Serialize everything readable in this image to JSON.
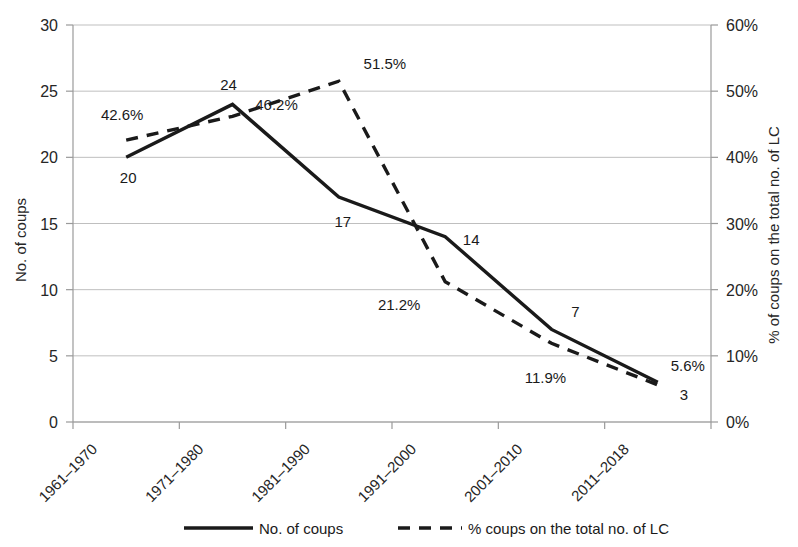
{
  "chart_data": {
    "type": "line",
    "title": "",
    "xlabel": "",
    "ylabel": "No. of coups",
    "y2label": "% of coups on the total no. of LC",
    "categories": [
      "1961–1970",
      "1971–1980",
      "1981–1990",
      "1991–2000",
      "2001–2010",
      "2011–2018"
    ],
    "ylim": [
      0,
      30
    ],
    "y2lim": [
      0,
      60
    ],
    "yticks": [
      "0",
      "5",
      "10",
      "15",
      "20",
      "25",
      "30"
    ],
    "ytick_values": [
      0,
      5,
      10,
      15,
      20,
      25,
      30
    ],
    "y2ticks": [
      "0%",
      "10%",
      "20%",
      "30%",
      "40%",
      "50%",
      "60%"
    ],
    "y2tick_values": [
      0,
      10,
      20,
      30,
      40,
      50,
      60
    ],
    "grid": true,
    "legend_position": "bottom",
    "series": [
      {
        "name": "No. of coups",
        "axis": "left",
        "style": "solid",
        "color": "#1a1a1a",
        "values": [
          20,
          24,
          17,
          14,
          7,
          3
        ],
        "data_labels": [
          "20",
          "24",
          "17",
          "14",
          "7",
          "3"
        ]
      },
      {
        "name": "% coups on the total no. of LC",
        "axis": "right",
        "style": "dashed",
        "color": "#1a1a1a",
        "values": [
          42.6,
          46.2,
          51.5,
          21.2,
          11.9,
          5.6
        ],
        "data_labels": [
          "42.6%",
          "46.2%",
          "51.5%",
          "21.2%",
          "11.9%",
          "5.6%"
        ]
      }
    ]
  },
  "axes": {
    "left_title": "No. of coups",
    "right_title": "% of coups on the total no. of LC"
  },
  "legend": {
    "items": [
      {
        "label": "No. of coups",
        "style": "solid"
      },
      {
        "label": "% coups on the total no. of LC",
        "style": "dashed"
      }
    ]
  }
}
